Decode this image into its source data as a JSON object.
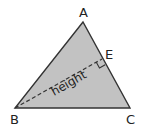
{
  "diagram": {
    "colors": {
      "fill": "#c2c2c2",
      "stroke": "#333333",
      "text": "#222222"
    },
    "vertices": {
      "A": {
        "label": "A",
        "x": 83,
        "y": 22
      },
      "B": {
        "label": "B",
        "x": 15,
        "y": 108
      },
      "C": {
        "label": "C",
        "x": 130,
        "y": 108
      }
    },
    "foot": {
      "label": "E",
      "x": 102,
      "y": 59
    },
    "height_segment": {
      "from": "B",
      "to": "E",
      "label": "height",
      "style": "dashed"
    },
    "right_angle_marker": {
      "at": "E"
    }
  }
}
